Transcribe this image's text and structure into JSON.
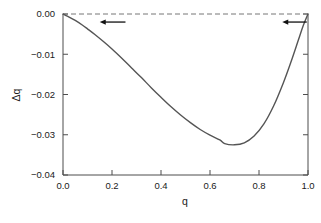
{
  "chart_data": {
    "type": "line",
    "title": "",
    "xlabel": "q",
    "ylabel": "Δq",
    "xlim": [
      0.0,
      1.0
    ],
    "ylim": [
      -0.04,
      0.0
    ],
    "grid": false,
    "legend": null,
    "xticks": [
      "0.0",
      "0.2",
      "0.4",
      "0.6",
      "0.8",
      "1.0"
    ],
    "xtick_values": [
      0.0,
      0.2,
      0.4,
      0.6,
      0.8,
      1.0
    ],
    "yticks": [
      "0.00",
      "−0.01",
      "−0.02",
      "−0.03",
      "−0.04"
    ],
    "ytick_values": [
      0.0,
      -0.01,
      -0.02,
      -0.03,
      -0.04
    ],
    "series": [
      {
        "name": "Δq(q)",
        "style": "solid",
        "color": "#555555",
        "x": [
          0.0,
          0.02,
          0.05,
          0.08,
          0.1,
          0.13,
          0.16,
          0.2,
          0.24,
          0.28,
          0.32,
          0.36,
          0.4,
          0.44,
          0.48,
          0.52,
          0.56,
          0.6,
          0.64,
          0.66,
          0.7,
          0.74,
          0.78,
          0.82,
          0.86,
          0.9,
          0.93,
          0.96,
          0.98,
          1.0
        ],
        "y": [
          0.0,
          -0.0006,
          -0.0016,
          -0.0028,
          -0.0037,
          -0.0051,
          -0.0066,
          -0.0087,
          -0.011,
          -0.0134,
          -0.0158,
          -0.0183,
          -0.0207,
          -0.023,
          -0.0251,
          -0.027,
          -0.0287,
          -0.0301,
          -0.0313,
          -0.0322,
          -0.0325,
          -0.032,
          -0.0303,
          -0.0273,
          -0.0228,
          -0.017,
          -0.012,
          -0.0066,
          -0.003,
          0.0
        ]
      },
      {
        "name": "zero-reference",
        "style": "dashed",
        "color": "#777777",
        "x": [
          0.0,
          1.0
        ],
        "y": [
          0.0,
          0.0
        ]
      }
    ],
    "annotations": [
      {
        "kind": "arrow",
        "direction": "left",
        "x_start": 0.255,
        "x_end": 0.15,
        "y": -0.002,
        "color": "#111111"
      },
      {
        "kind": "arrow",
        "direction": "left",
        "x_start": 0.995,
        "x_end": 0.895,
        "y": -0.002,
        "color": "#111111"
      }
    ],
    "minimum": {
      "q": 0.66,
      "delta_q": -0.0325
    }
  }
}
